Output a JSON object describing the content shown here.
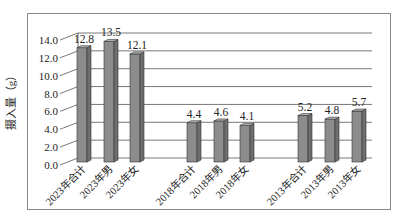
{
  "chart_data": {
    "type": "bar",
    "title": "",
    "xlabel": "",
    "ylabel": "摄入量（g）",
    "ylim": [
      0,
      14
    ],
    "yticks": [
      "0.0",
      "2.0",
      "4.0",
      "6.0",
      "8.0",
      "10.0",
      "12.0",
      "14.0"
    ],
    "grid": true,
    "legend": null,
    "style": "3d-column",
    "bar_color": "#8c8c8c",
    "categories": [
      "2023年合计",
      "2023年男",
      "2023年女",
      "2018年合计",
      "2018年男",
      "2018年女",
      "2013年合计",
      "2013年男",
      "2013年女"
    ],
    "values": [
      12.8,
      13.5,
      12.1,
      4.4,
      4.6,
      4.1,
      5.2,
      4.8,
      5.7
    ],
    "data_labels": [
      "12.8",
      "13.5",
      "12.1",
      "4.4",
      "4.6",
      "4.1",
      "5.2",
      "4.8",
      "5.7"
    ]
  }
}
